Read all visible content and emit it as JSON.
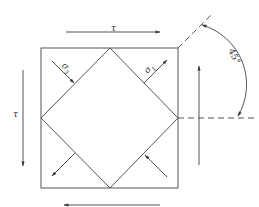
{
  "diagram": {
    "colors": {
      "stroke": "#555555",
      "dashed": "#555555",
      "text": "#333333",
      "background": "#ffffff"
    },
    "labels": {
      "tau_top": "τ",
      "tau_left": "τ",
      "sigma3": "σ",
      "sigma3_sub": "3",
      "sigma1": "σ",
      "sigma1_sub": "1",
      "angle": "45°"
    },
    "elements": {
      "outer_square": {
        "x": 41,
        "y": 48,
        "width": 137,
        "height": 140
      },
      "inner_diamond": {
        "top": [
          110,
          48
        ],
        "right": [
          178,
          118
        ],
        "bottom": [
          110,
          188
        ],
        "left": [
          41,
          118
        ]
      },
      "shear_arrows": [
        {
          "name": "top",
          "direction": "right",
          "from": [
            66,
            32
          ],
          "to": [
            160,
            32
          ],
          "label": "τ"
        },
        {
          "name": "bottom",
          "direction": "left",
          "from": [
            160,
            205
          ],
          "to": [
            64,
            205
          ],
          "label": ""
        },
        {
          "name": "left",
          "direction": "down",
          "from": [
            23,
            70
          ],
          "to": [
            23,
            166
          ],
          "label": "τ"
        },
        {
          "name": "right",
          "direction": "up",
          "from": [
            199,
            165
          ],
          "to": [
            199,
            66
          ],
          "label": ""
        }
      ],
      "principal_arrows": [
        {
          "name": "sigma3-top-left",
          "type": "compression",
          "label": "σ3"
        },
        {
          "name": "sigma1-top-right",
          "type": "tension",
          "label": "σ1"
        },
        {
          "name": "sigma1-bottom-left",
          "type": "tension",
          "label": ""
        },
        {
          "name": "sigma3-bottom-right",
          "type": "compression",
          "label": ""
        }
      ],
      "angle_annotation": {
        "value": "45°",
        "center": [
          178,
          118
        ]
      }
    }
  }
}
